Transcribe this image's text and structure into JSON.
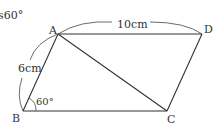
{
  "figure": {
    "partial_text": "s60°",
    "shape": "parallelogram",
    "vertices": {
      "A": {
        "label": "A",
        "x": 58,
        "y": 34
      },
      "B": {
        "label": "B",
        "x": 23,
        "y": 111
      },
      "C": {
        "label": "C",
        "x": 167,
        "y": 111
      },
      "D": {
        "label": "D",
        "x": 202,
        "y": 34
      }
    },
    "diagonal": "AC",
    "measurements": {
      "AD": "10cm",
      "AB": "6cm",
      "angle_B": "60°"
    },
    "colors": {
      "line": "#333333",
      "background": "#ffffff"
    }
  }
}
